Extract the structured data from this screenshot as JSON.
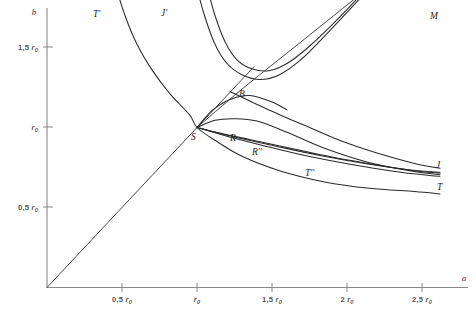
{
  "figure": {
    "background_color": "#ffffff",
    "axis_color": "#8a8a8a",
    "curve_color": "#2a2a2a",
    "label_color": "#555555"
  },
  "chart_data": {
    "type": "line",
    "title": "",
    "subtitle": "",
    "xlabel": "a",
    "ylabel": "b",
    "grid": false,
    "legend": "inline-curve-labels",
    "xlim": [
      0,
      2.75
    ],
    "ylim": [
      0,
      1.9
    ],
    "x_ticks": [
      {
        "value": 0.5,
        "label": "0,5 r",
        "sub": "0"
      },
      {
        "value": 1.0,
        "label": "r",
        "sub": "0"
      },
      {
        "value": 1.5,
        "label": "1,5 r",
        "sub": "0"
      },
      {
        "value": 2.0,
        "label": "2 r",
        "sub": "0"
      },
      {
        "value": 2.5,
        "label": "2,5 r",
        "sub": "0"
      }
    ],
    "y_ticks": [
      {
        "value": 0.5,
        "label": "0,5 r",
        "sub": "0"
      },
      {
        "value": 1.0,
        "label": "r",
        "sub": "0"
      },
      {
        "value": 1.5,
        "label": "1,5 r",
        "sub": "0"
      }
    ],
    "annotations": [
      {
        "name": "point-S",
        "text": "S",
        "x": 1.0,
        "y": 1.0
      },
      {
        "name": "point-B",
        "text": "B",
        "x": 1.305,
        "y": 1.245
      }
    ],
    "series": [
      {
        "name": "T-prime",
        "label": "T'",
        "description": "steeply descending hyperbolic branch from upper-left through S and continuing to lower-right",
        "points": [
          [
            0.445,
            1.92
          ],
          [
            0.52,
            1.7
          ],
          [
            0.6,
            1.52
          ],
          [
            0.7,
            1.36
          ],
          [
            0.82,
            1.21
          ],
          [
            0.95,
            1.08
          ],
          [
            1.0,
            1.0
          ],
          [
            1.12,
            0.92
          ],
          [
            1.3,
            0.82
          ],
          [
            1.55,
            0.73
          ],
          [
            1.85,
            0.66
          ],
          [
            2.15,
            0.62
          ],
          [
            2.45,
            0.6
          ],
          [
            2.62,
            0.585
          ]
        ]
      },
      {
        "name": "J-prime",
        "label": "J'",
        "description": "outer U-shaped branch descending from upper-left, turning at minimum and rising to upper-right toward M",
        "points": [
          [
            0.985,
            1.92
          ],
          [
            1.05,
            1.7
          ],
          [
            1.12,
            1.52
          ],
          [
            1.2,
            1.4
          ],
          [
            1.3,
            1.33
          ],
          [
            1.42,
            1.3
          ],
          [
            1.55,
            1.33
          ],
          [
            1.7,
            1.43
          ],
          [
            1.9,
            1.62
          ],
          [
            2.1,
            1.82
          ],
          [
            2.2,
            1.92
          ]
        ]
      },
      {
        "name": "M-line",
        "label": "M",
        "description": "straight ray from S rising to the upper-right corner, passes through B",
        "points": [
          [
            1.0,
            1.0
          ],
          [
            1.3,
            1.24
          ],
          [
            1.7,
            1.54
          ],
          [
            2.1,
            1.84
          ],
          [
            2.22,
            1.92
          ]
        ]
      },
      {
        "name": "R-curve",
        "label": "R",
        "description": "curve from S rising slightly then descending to the right group",
        "points": [
          [
            1.0,
            1.0
          ],
          [
            1.12,
            1.045
          ],
          [
            1.25,
            1.055
          ],
          [
            1.4,
            1.04
          ],
          [
            1.6,
            0.97
          ],
          [
            1.85,
            0.87
          ],
          [
            2.15,
            0.78
          ],
          [
            2.45,
            0.725
          ],
          [
            2.62,
            0.705
          ]
        ]
      },
      {
        "name": "R-double-prime",
        "label": "R''",
        "description": "curve from S descending monotonically to the right convergence zone",
        "points": [
          [
            1.0,
            1.0
          ],
          [
            1.15,
            0.965
          ],
          [
            1.35,
            0.925
          ],
          [
            1.6,
            0.875
          ],
          [
            1.9,
            0.815
          ],
          [
            2.2,
            0.765
          ],
          [
            2.45,
            0.73
          ],
          [
            2.62,
            0.715
          ]
        ]
      },
      {
        "name": "T-double-prime",
        "label": "T''",
        "description": "lower descending curve through the middle of the right bundle",
        "points": [
          [
            1.0,
            1.0
          ],
          [
            1.1,
            0.975
          ],
          [
            1.28,
            0.935
          ],
          [
            1.52,
            0.885
          ],
          [
            1.82,
            0.825
          ],
          [
            2.12,
            0.775
          ],
          [
            2.42,
            0.735
          ],
          [
            2.62,
            0.72
          ]
        ]
      },
      {
        "name": "J-curve",
        "label": "J",
        "description": "upper member of the right-hand converging bundle",
        "points": [
          [
            1.22,
            1.225
          ],
          [
            1.32,
            1.18
          ],
          [
            1.48,
            1.11
          ],
          [
            1.7,
            1.02
          ],
          [
            1.95,
            0.92
          ],
          [
            2.2,
            0.84
          ],
          [
            2.45,
            0.775
          ],
          [
            2.62,
            0.745
          ]
        ]
      },
      {
        "name": "T-curve",
        "label": "T",
        "description": "lowest member of the right-hand converging bundle",
        "points": [
          [
            1.02,
            0.995
          ],
          [
            1.2,
            0.945
          ],
          [
            1.45,
            0.885
          ],
          [
            1.72,
            0.825
          ],
          [
            2.02,
            0.77
          ],
          [
            2.32,
            0.725
          ],
          [
            2.55,
            0.7
          ],
          [
            2.62,
            0.695
          ]
        ]
      },
      {
        "name": "inner-U-branch",
        "label": "",
        "description": "inner U-shaped branch nested inside J', minimum slightly higher than outer",
        "points": [
          [
            1.055,
            1.92
          ],
          [
            1.12,
            1.7
          ],
          [
            1.19,
            1.53
          ],
          [
            1.27,
            1.42
          ],
          [
            1.37,
            1.365
          ],
          [
            1.48,
            1.355
          ],
          [
            1.6,
            1.4
          ],
          [
            1.74,
            1.5
          ],
          [
            1.92,
            1.66
          ],
          [
            2.12,
            1.86
          ],
          [
            2.16,
            1.92
          ]
        ]
      },
      {
        "name": "diagonal-ray",
        "label": "",
        "description": "straight line from the origin through S continuing to upper right",
        "points": [
          [
            0.0,
            0.0
          ],
          [
            1.0,
            1.0
          ],
          [
            1.38,
            1.38
          ]
        ]
      },
      {
        "name": "lower-v-branch",
        "label": "",
        "description": "small V/parabolic arc below B joining S region and rising right",
        "points": [
          [
            1.0,
            1.0
          ],
          [
            1.1,
            1.105
          ],
          [
            1.22,
            1.175
          ],
          [
            1.35,
            1.2
          ],
          [
            1.5,
            1.16
          ],
          [
            1.6,
            1.11
          ]
        ]
      }
    ]
  },
  "axes": {
    "x_axis_name": "a",
    "y_axis_name": "b"
  },
  "curve_labels": [
    {
      "name": "label-T-prime",
      "text": "T'",
      "x": 93,
      "y": 17
    },
    {
      "name": "label-J-prime",
      "text": "J'",
      "x": 161,
      "y": 16
    },
    {
      "name": "label-M",
      "text": "M",
      "x": 430,
      "y": 19
    },
    {
      "name": "label-B",
      "text": "B",
      "x": 239,
      "y": 97
    },
    {
      "name": "label-S",
      "text": "S",
      "x": 191,
      "y": 140
    },
    {
      "name": "label-R",
      "text": "R",
      "x": 230,
      "y": 141
    },
    {
      "name": "label-R-double-prime",
      "text": "R''",
      "x": 252,
      "y": 155
    },
    {
      "name": "label-T-double-prime",
      "text": "T''",
      "x": 305,
      "y": 176
    },
    {
      "name": "label-J",
      "text": "J",
      "x": 436,
      "y": 168
    },
    {
      "name": "label-T",
      "text": "T",
      "x": 437,
      "y": 190
    }
  ]
}
